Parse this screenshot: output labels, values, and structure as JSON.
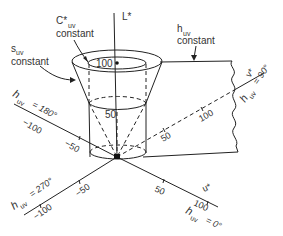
{
  "diagram": {
    "axes": {
      "l_star": "L*",
      "u_star": "u*",
      "v_star": "v*"
    },
    "hue_labels": {
      "h0": {
        "sym": "h",
        "sub": "uv",
        "val": "= 0°"
      },
      "h90": {
        "sym": "h",
        "sub": "uv",
        "val": "= 90°"
      },
      "h180": {
        "sym": "h",
        "sub": "uv",
        "val": "= 180°"
      },
      "h270": {
        "sym": "h",
        "sub": "uv",
        "val": "= 270°"
      }
    },
    "annotations": {
      "chroma": {
        "sym": "C*",
        "sub": "uv",
        "line2": "constant"
      },
      "saturation": {
        "sym": "s",
        "sub": "uv",
        "line2": "constant"
      },
      "hue": {
        "sym": "h",
        "sub": "uv",
        "line2": "constant"
      }
    },
    "ticks": {
      "l_100": "100",
      "l_50": "50",
      "u_50": "50",
      "u_100": "100",
      "v_50": "50",
      "v_100": "100",
      "neg_u_50": "−50",
      "neg_u_100": "−100",
      "neg_v_50": "−50",
      "neg_v_100": "−100"
    }
  }
}
